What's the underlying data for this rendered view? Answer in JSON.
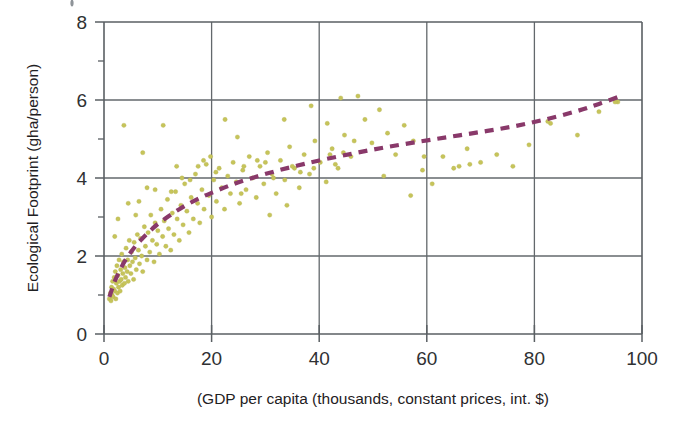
{
  "figure": {
    "name": "ecological-footprint-vs-gdp-scatter",
    "background_color": "#ffffff"
  },
  "chart_data": {
    "type": "scatter",
    "title": "",
    "subtitle": "",
    "xlabel": "(GDP per capita (thousands, constant prices, int. $)",
    "ylabel": "Ecological Footprint (gha/person)",
    "xlim": [
      0,
      100
    ],
    "ylim": [
      0,
      8
    ],
    "xticks": [
      0,
      20,
      40,
      60,
      80,
      100
    ],
    "xtick_labels": [
      "0",
      "20",
      "40",
      "60",
      "80",
      "100"
    ],
    "yticks": [
      0,
      2,
      4,
      6,
      8
    ],
    "ytick_labels": [
      "0",
      "2",
      "4",
      "6",
      "8"
    ],
    "x_minor_ticks": [
      10,
      30,
      50,
      70,
      90
    ],
    "y_minor_ticks": [
      1,
      3,
      5,
      7
    ],
    "grid": true,
    "grid_axis": "both",
    "legend": false,
    "legend_position": "none",
    "series": [
      {
        "name": "Countries",
        "type": "scatter",
        "marker": "circle",
        "marker_size": 3,
        "color": "#c6c45a",
        "points": [
          [
            1.0,
            0.9
          ],
          [
            1.2,
            1.05
          ],
          [
            1.3,
            0.85
          ],
          [
            1.4,
            1.2
          ],
          [
            1.5,
            1.0
          ],
          [
            1.6,
            1.35
          ],
          [
            1.7,
            0.95
          ],
          [
            1.8,
            1.15
          ],
          [
            1.9,
            1.45
          ],
          [
            2.0,
            1.1
          ],
          [
            2.1,
            1.6
          ],
          [
            2.2,
            0.9
          ],
          [
            2.3,
            1.3
          ],
          [
            2.4,
            1.75
          ],
          [
            2.5,
            1.05
          ],
          [
            2.6,
            1.5
          ],
          [
            2.7,
            1.2
          ],
          [
            2.8,
            1.9
          ],
          [
            2.9,
            1.35
          ],
          [
            3.0,
            1.1
          ],
          [
            3.1,
            1.65
          ],
          [
            3.2,
            1.4
          ],
          [
            3.3,
            2.05
          ],
          [
            3.4,
            1.25
          ],
          [
            3.5,
            1.55
          ],
          [
            3.6,
            1.85
          ],
          [
            3.8,
            1.3
          ],
          [
            3.9,
            1.7
          ],
          [
            4.0,
            1.45
          ],
          [
            4.1,
            2.2
          ],
          [
            4.3,
            1.6
          ],
          [
            4.4,
            1.9
          ],
          [
            4.5,
            1.35
          ],
          [
            4.7,
            2.4
          ],
          [
            4.8,
            1.75
          ],
          [
            5.0,
            1.55
          ],
          [
            5.1,
            2.1
          ],
          [
            5.3,
            1.85
          ],
          [
            5.5,
            1.4
          ],
          [
            5.6,
            2.35
          ],
          [
            5.8,
            1.95
          ],
          [
            6.0,
            1.65
          ],
          [
            6.2,
            2.55
          ],
          [
            6.4,
            2.15
          ],
          [
            6.6,
            1.8
          ],
          [
            6.8,
            2.45
          ],
          [
            7.0,
            2.0
          ],
          [
            7.2,
            1.6
          ],
          [
            7.5,
            2.75
          ],
          [
            7.7,
            2.25
          ],
          [
            8.0,
            1.9
          ],
          [
            8.2,
            2.6
          ],
          [
            8.5,
            2.1
          ],
          [
            8.7,
            3.05
          ],
          [
            9.0,
            2.4
          ],
          [
            9.3,
            1.85
          ],
          [
            9.5,
            2.85
          ],
          [
            9.8,
            2.3
          ],
          [
            10.0,
            2.65
          ],
          [
            10.3,
            2.05
          ],
          [
            10.6,
            3.2
          ],
          [
            10.9,
            2.5
          ],
          [
            11.2,
            2.9
          ],
          [
            11.5,
            2.25
          ],
          [
            11.8,
            3.45
          ],
          [
            12.0,
            2.7
          ],
          [
            12.4,
            2.15
          ],
          [
            12.7,
            3.1
          ],
          [
            13.0,
            2.55
          ],
          [
            13.3,
            3.65
          ],
          [
            13.6,
            2.95
          ],
          [
            14.0,
            2.4
          ],
          [
            14.3,
            3.3
          ],
          [
            14.7,
            2.8
          ],
          [
            15.0,
            3.85
          ],
          [
            15.4,
            3.15
          ],
          [
            15.8,
            2.6
          ],
          [
            16.2,
            3.5
          ],
          [
            16.6,
            2.95
          ],
          [
            17.0,
            4.1
          ],
          [
            17.4,
            3.35
          ],
          [
            17.8,
            2.85
          ],
          [
            18.2,
            3.7
          ],
          [
            18.6,
            3.2
          ],
          [
            19.0,
            4.35
          ],
          [
            19.5,
            3.55
          ],
          [
            20.0,
            3.0
          ],
          [
            20.4,
            3.95
          ],
          [
            20.9,
            3.4
          ],
          [
            21.4,
            4.25
          ],
          [
            21.9,
            3.75
          ],
          [
            22.4,
            3.2
          ],
          [
            23.0,
            4.05
          ],
          [
            23.5,
            3.6
          ],
          [
            24.0,
            4.4
          ],
          [
            24.6,
            3.9
          ],
          [
            25.2,
            3.35
          ],
          [
            25.8,
            4.2
          ],
          [
            26.4,
            3.7
          ],
          [
            27.0,
            4.55
          ],
          [
            27.6,
            4.0
          ],
          [
            28.3,
            3.5
          ],
          [
            29.0,
            4.3
          ],
          [
            29.7,
            3.85
          ],
          [
            30.4,
            4.65
          ],
          [
            31.2,
            4.1
          ],
          [
            32.0,
            3.6
          ],
          [
            32.8,
            4.45
          ],
          [
            33.6,
            3.95
          ],
          [
            34.5,
            4.8
          ],
          [
            35.4,
            4.25
          ],
          [
            36.3,
            3.75
          ],
          [
            37.2,
            4.6
          ],
          [
            38.2,
            4.1
          ],
          [
            39.2,
            4.95
          ],
          [
            40.2,
            4.4
          ],
          [
            41.3,
            3.9
          ],
          [
            42.4,
            4.75
          ],
          [
            43.5,
            4.25
          ],
          [
            44.7,
            5.1
          ],
          [
            45.9,
            4.55
          ],
          [
            47.2,
            6.1
          ],
          [
            48.5,
            5.5
          ],
          [
            49.8,
            4.9
          ],
          [
            51.2,
            5.75
          ],
          [
            52.7,
            5.15
          ],
          [
            54.2,
            4.6
          ],
          [
            55.8,
            5.35
          ],
          [
            57.5,
            4.95
          ],
          [
            59.2,
            4.2
          ],
          [
            61.0,
            3.85
          ],
          [
            63.0,
            4.55
          ],
          [
            65.0,
            4.25
          ],
          [
            67.5,
            4.75
          ],
          [
            70.0,
            4.4
          ],
          [
            73.0,
            4.6
          ],
          [
            76.0,
            4.3
          ],
          [
            79.0,
            4.85
          ],
          [
            83.0,
            5.4
          ],
          [
            88.0,
            5.1
          ],
          [
            92.0,
            5.7
          ],
          [
            95.5,
            5.95
          ],
          [
            3.7,
            5.35
          ],
          [
            11.0,
            5.35
          ],
          [
            22.5,
            5.5
          ],
          [
            24.8,
            5.05
          ],
          [
            33.5,
            5.5
          ],
          [
            38.5,
            5.85
          ],
          [
            41.5,
            5.4
          ],
          [
            44.0,
            6.05
          ],
          [
            46.5,
            4.95
          ],
          [
            44.5,
            4.65
          ],
          [
            42.0,
            4.6
          ],
          [
            43.0,
            4.35
          ],
          [
            2.6,
            2.95
          ],
          [
            4.5,
            3.35
          ],
          [
            7.2,
            4.65
          ],
          [
            13.5,
            4.3
          ],
          [
            17.5,
            4.3
          ],
          [
            20.8,
            4.15
          ],
          [
            26.0,
            4.3
          ],
          [
            30.0,
            4.4
          ],
          [
            28.5,
            4.45
          ],
          [
            31.5,
            4.0
          ],
          [
            35.0,
            4.3
          ],
          [
            36.5,
            4.15
          ],
          [
            39.0,
            4.25
          ],
          [
            25.5,
            3.6
          ],
          [
            30.8,
            3.05
          ],
          [
            34.0,
            3.3
          ],
          [
            8.0,
            3.75
          ],
          [
            9.5,
            3.7
          ],
          [
            12.5,
            3.65
          ],
          [
            14.5,
            4.0
          ],
          [
            16.0,
            3.95
          ],
          [
            18.5,
            4.45
          ],
          [
            19.8,
            4.55
          ],
          [
            52.0,
            4.05
          ],
          [
            57.0,
            3.55
          ],
          [
            59.5,
            4.55
          ],
          [
            66.0,
            4.3
          ],
          [
            68.0,
            4.35
          ],
          [
            82.5,
            5.45
          ],
          [
            95.0,
            5.95
          ],
          [
            5.9,
            3.05
          ],
          [
            6.5,
            3.4
          ],
          [
            2.0,
            2.5
          ]
        ]
      },
      {
        "name": "Logarithmic trend",
        "type": "line",
        "style": "dashed",
        "color": "#89396a",
        "points": [
          [
            1.0,
            0.95
          ],
          [
            2.0,
            1.35
          ],
          [
            3.0,
            1.65
          ],
          [
            4.0,
            1.9
          ],
          [
            5.0,
            2.1
          ],
          [
            6.0,
            2.28
          ],
          [
            7.0,
            2.43
          ],
          [
            8.0,
            2.57
          ],
          [
            9.0,
            2.7
          ],
          [
            10.0,
            2.82
          ],
          [
            12.0,
            3.02
          ],
          [
            14.0,
            3.2
          ],
          [
            16.0,
            3.36
          ],
          [
            18.0,
            3.5
          ],
          [
            20.0,
            3.62
          ],
          [
            24.0,
            3.84
          ],
          [
            28.0,
            4.02
          ],
          [
            32.0,
            4.18
          ],
          [
            36.0,
            4.32
          ],
          [
            40.0,
            4.45
          ],
          [
            46.0,
            4.62
          ],
          [
            52.0,
            4.78
          ],
          [
            58.0,
            4.92
          ],
          [
            64.0,
            5.05
          ],
          [
            70.0,
            5.18
          ],
          [
            76.0,
            5.32
          ],
          [
            82.0,
            5.5
          ],
          [
            88.0,
            5.72
          ],
          [
            92.0,
            5.9
          ],
          [
            96.0,
            6.1
          ]
        ]
      }
    ]
  }
}
